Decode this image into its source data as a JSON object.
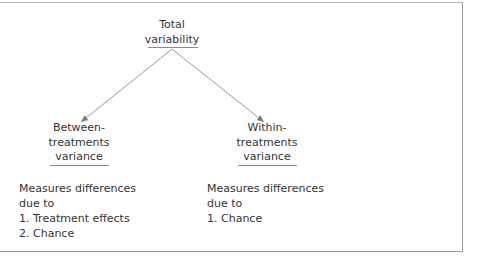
{
  "diagram": {
    "root": {
      "lines": [
        "Total",
        "variability"
      ]
    },
    "children": [
      {
        "id": "between",
        "lines": [
          "Between-",
          "treatments",
          "variance"
        ],
        "description": [
          "Measures differences",
          "due to",
          "1. Treatment effects",
          "2. Chance"
        ]
      },
      {
        "id": "within",
        "lines": [
          "Within-",
          "treatments",
          "variance"
        ],
        "description": [
          "Measures differences",
          "due to",
          "1. Chance"
        ]
      }
    ],
    "edges": [
      {
        "from": "Total variability",
        "to": "Between-treatments variance"
      },
      {
        "from": "Total variability",
        "to": "Within-treatments variance"
      }
    ],
    "colors": {
      "text": "#333333",
      "arrow": "#8c8c8c",
      "frame": "#9a9a9a"
    }
  }
}
